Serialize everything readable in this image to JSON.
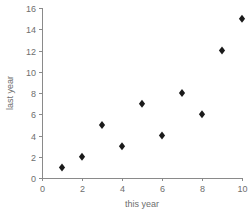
{
  "chart_data": {
    "type": "scatter",
    "title": "",
    "xlabel": "this year",
    "ylabel": "last year",
    "xlim": [
      0,
      10
    ],
    "ylim": [
      0,
      16
    ],
    "grid": false,
    "legend": false,
    "x_ticks": [
      "0",
      "2",
      "4",
      "6",
      "8",
      "10"
    ],
    "x_tick_values": [
      0,
      2,
      4,
      6,
      8,
      10
    ],
    "y_ticks": [
      "0",
      "2",
      "4",
      "6",
      "8",
      "10",
      "12",
      "14",
      "16"
    ],
    "y_tick_values": [
      0,
      2,
      4,
      6,
      8,
      10,
      12,
      14,
      16
    ],
    "marker": "diamond",
    "marker_color": "#1a1a1a",
    "axis_color": "#8a8a8a",
    "label_color": "#6e6e6e",
    "background_color": "#ffffff",
    "points": [
      {
        "x": 1,
        "y": 1
      },
      {
        "x": 2,
        "y": 2
      },
      {
        "x": 3,
        "y": 5
      },
      {
        "x": 4,
        "y": 3
      },
      {
        "x": 5,
        "y": 7
      },
      {
        "x": 6,
        "y": 4
      },
      {
        "x": 7,
        "y": 8
      },
      {
        "x": 8,
        "y": 6
      },
      {
        "x": 9,
        "y": 12
      },
      {
        "x": 10,
        "y": 15
      }
    ],
    "x": [
      1,
      2,
      3,
      4,
      5,
      6,
      7,
      8,
      9,
      10
    ],
    "values": [
      1,
      2,
      5,
      3,
      7,
      4,
      8,
      6,
      12,
      15
    ]
  },
  "geometry": {
    "plot_left": 42,
    "plot_right": 242,
    "plot_bottom": 178,
    "plot_top": 8,
    "tick_len": 3,
    "marker_rx": 3.1,
    "marker_ry": 4.0,
    "x_label_pos": {
      "x": 142,
      "y": 207
    },
    "y_label_pos": {
      "x": 13,
      "y": 93
    }
  }
}
